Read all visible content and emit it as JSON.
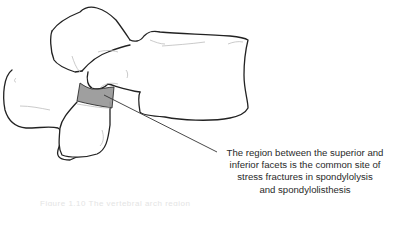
{
  "figure": {
    "highlight_color": "#9a9a9a",
    "outline_color": "#222222",
    "detail_line_color": "#bdbdbd"
  },
  "annotation": {
    "lines": [
      "The region between the superior and",
      "inferior facets is the common site of",
      "stress fractures in spondylolysis",
      "and spondylolisthesis"
    ]
  },
  "caption": {
    "text": "Figure 1.10  The vertebral arch region"
  }
}
